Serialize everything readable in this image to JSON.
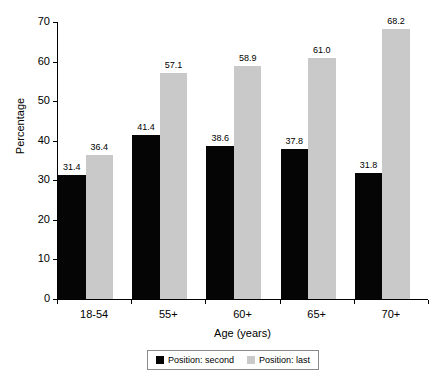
{
  "chart_data": {
    "type": "bar",
    "title": "",
    "subtitle": "",
    "xlabel": "Age (years)",
    "ylabel": "Percentage",
    "categories": [
      "18-54",
      "55+",
      "60+",
      "65+",
      "70+"
    ],
    "series": [
      {
        "name": "Position: second",
        "color": "#050505",
        "values": [
          31.4,
          41.4,
          38.6,
          37.8,
          31.8
        ],
        "labels": [
          "31.4",
          "41.4",
          "38.6",
          "37.8",
          "31.8"
        ]
      },
      {
        "name": "Position: last",
        "color": "#c9c9c9",
        "values": [
          36.4,
          57.1,
          58.9,
          61.0,
          68.2
        ],
        "labels": [
          "36.4",
          "57.1",
          "58.9",
          "61.0",
          "68.2"
        ]
      }
    ],
    "ylim": [
      0,
      70
    ],
    "yticks": [
      0,
      10,
      20,
      30,
      40,
      50,
      60,
      70
    ],
    "ytick_labels": [
      "0",
      "10",
      "20",
      "30",
      "40",
      "50",
      "60",
      "70"
    ],
    "grid": false,
    "legend_position": "bottom",
    "data_labels_shown": true
  }
}
